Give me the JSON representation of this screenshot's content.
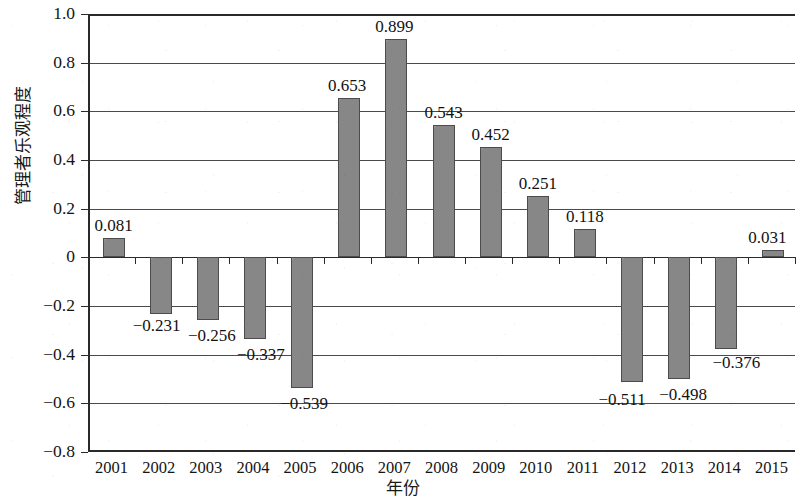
{
  "chart_data": {
    "type": "bar",
    "title": "",
    "xlabel": "年份",
    "ylabel": "管理者乐观程度",
    "categories": [
      "2001",
      "2002",
      "2003",
      "2004",
      "2005",
      "2006",
      "2007",
      "2008",
      "2009",
      "2010",
      "2011",
      "2012",
      "2013",
      "2014",
      "2015"
    ],
    "values": [
      0.081,
      -0.231,
      -0.256,
      -0.337,
      -0.539,
      0.653,
      0.899,
      0.543,
      0.452,
      0.251,
      0.118,
      -0.511,
      -0.498,
      -0.376,
      0.031
    ],
    "data_labels": [
      "0.081",
      "−0.231",
      "−0.256",
      "−0.337",
      "−0.539",
      "0.653",
      "0.899",
      "0.543",
      "0.452",
      "0.251",
      "0.118",
      "−0.511",
      "−0.498",
      "−0.376",
      "0.031"
    ],
    "ylim": [
      -0.8,
      1.0
    ],
    "ytick_values": [
      1.0,
      0.8,
      0.6,
      0.4,
      0.2,
      0,
      -0.2,
      -0.4,
      -0.6,
      -0.8
    ],
    "ytick_labels": [
      "1.0",
      "0.8",
      "0.6",
      "0.4",
      "0.2",
      "0",
      "−0.2",
      "−0.4",
      "−0.6",
      "−0.8"
    ],
    "grid": "horizontal",
    "legend": "none",
    "bar_color": "#878787",
    "bar_edge_color": "#4c4c4c",
    "axis_color": "#2a2a2a"
  }
}
